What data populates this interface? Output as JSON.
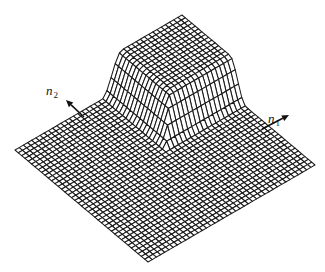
{
  "figure": {
    "background": "#ffffff",
    "line_color": "#1a1a1a"
  },
  "labels": {
    "n1": {
      "base": "n",
      "sub": "1",
      "x": 268,
      "y": 112
    },
    "n2": {
      "base": "n",
      "sub": "2",
      "x": 46,
      "y": 84
    }
  },
  "arrows": {
    "n1": {
      "from": [
        262,
        129
      ],
      "to": [
        289,
        115
      ]
    },
    "n2": {
      "from": [
        84,
        117
      ],
      "to": [
        66,
        100
      ]
    }
  },
  "mesh": {
    "grid_lines": 40,
    "front_corner": [
      148,
      262
    ],
    "left_corner": [
      15,
      150
    ],
    "right_corner": [
      315,
      165
    ],
    "plateau_start": 0.64,
    "ramp_start": 0.52,
    "plateau_height": 38
  }
}
